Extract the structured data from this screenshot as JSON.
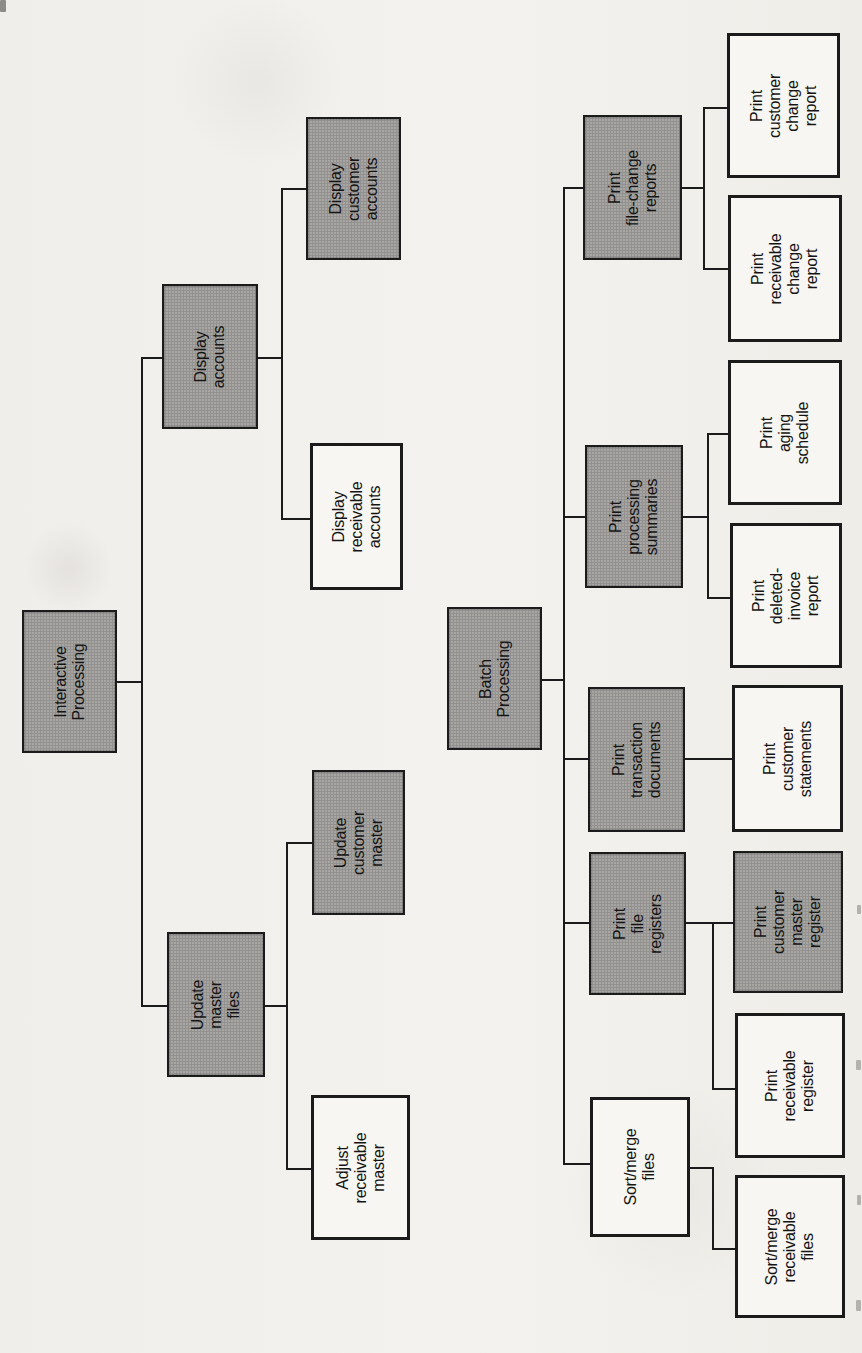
{
  "diagram": {
    "type": "structure-chart",
    "orientation": "page-rotated-90-text-reads-bottom-to-top",
    "colors": {
      "paper": "#f2f0ec",
      "shaded_box_fill": "#a8a6a3",
      "plain_box_fill": "#f7f6f2",
      "border": "#1b1b1b",
      "line": "#1b1b1b",
      "text": "#141414"
    },
    "trees": [
      {
        "root_id": "interactive-processing",
        "root_label": "Interactive Processing"
      },
      {
        "root_id": "batch-processing",
        "root_label": "Batch Processing"
      }
    ]
  },
  "nodes": [
    {
      "id": "interactive-processing",
      "label": "Interactive\nProcessing",
      "parent": null,
      "shaded": true,
      "x": 22,
      "y": 610,
      "w": 95,
      "h": 143
    },
    {
      "id": "display-accounts",
      "label": "Display\naccounts",
      "parent": "interactive-processing",
      "shaded": true,
      "x": 162,
      "y": 284,
      "w": 96,
      "h": 145
    },
    {
      "id": "display-customer-accounts",
      "label": "Display\ncustomer\naccounts",
      "parent": "display-accounts",
      "shaded": true,
      "x": 306,
      "y": 117,
      "w": 95,
      "h": 143
    },
    {
      "id": "display-receivable-accounts",
      "label": "Display\nreceivable\naccounts",
      "parent": "display-accounts",
      "shaded": false,
      "x": 310,
      "y": 443,
      "w": 93,
      "h": 147
    },
    {
      "id": "update-master-files",
      "label": "Update\nmaster\nfiles",
      "parent": "interactive-processing",
      "shaded": true,
      "x": 167,
      "y": 932,
      "w": 98,
      "h": 145
    },
    {
      "id": "update-customer-master",
      "label": "Update\ncustomer\nmaster",
      "parent": "update-master-files",
      "shaded": true,
      "x": 312,
      "y": 770,
      "w": 93,
      "h": 145
    },
    {
      "id": "adjust-receivable-master",
      "label": "Adjust\nreceivable\nmaster",
      "parent": "update-master-files",
      "shaded": false,
      "x": 311,
      "y": 1095,
      "w": 99,
      "h": 145
    },
    {
      "id": "batch-processing",
      "label": "Batch\nProcessing",
      "parent": null,
      "shaded": true,
      "x": 447,
      "y": 607,
      "w": 95,
      "h": 143
    },
    {
      "id": "print-file-change-reports",
      "label": "Print\nfile-change\nreports",
      "parent": "batch-processing",
      "shaded": true,
      "x": 583,
      "y": 115,
      "w": 99,
      "h": 145
    },
    {
      "id": "print-customer-change-report",
      "label": "Print\ncustomer\nchange\nreport",
      "parent": "print-file-change-reports",
      "shaded": false,
      "x": 727,
      "y": 33,
      "w": 113,
      "h": 145
    },
    {
      "id": "print-receivable-change-report",
      "label": "Print\nreceivable\nchange\nreport",
      "parent": "print-file-change-reports",
      "shaded": false,
      "x": 728,
      "y": 195,
      "w": 114,
      "h": 147
    },
    {
      "id": "print-processing-summaries",
      "label": "Print\nprocessing\nsummaries",
      "parent": "batch-processing",
      "shaded": true,
      "x": 585,
      "y": 445,
      "w": 98,
      "h": 143
    },
    {
      "id": "print-aging-schedule",
      "label": "Print\naging\nschedule",
      "parent": "print-processing-summaries",
      "shaded": false,
      "x": 728,
      "y": 360,
      "w": 114,
      "h": 145
    },
    {
      "id": "print-deleted-invoice-report",
      "label": "Print\ndeleted-\ninvoice\nreport",
      "parent": "print-processing-summaries",
      "shaded": false,
      "x": 730,
      "y": 523,
      "w": 112,
      "h": 145
    },
    {
      "id": "print-transaction-documents",
      "label": "Print\ntransaction\ndocuments",
      "parent": "batch-processing",
      "shaded": true,
      "x": 588,
      "y": 687,
      "w": 97,
      "h": 145
    },
    {
      "id": "print-customer-statements",
      "label": "Print\ncustomer\nstatements",
      "parent": "print-transaction-documents",
      "shaded": false,
      "x": 732,
      "y": 685,
      "w": 111,
      "h": 147
    },
    {
      "id": "print-file-registers",
      "label": "Print\nfile\nregisters",
      "parent": "batch-processing",
      "shaded": true,
      "x": 589,
      "y": 852,
      "w": 97,
      "h": 143
    },
    {
      "id": "print-customer-master-register",
      "label": "Print\ncustomer\nmaster\nregister",
      "parent": "print-file-registers",
      "shaded": true,
      "x": 733,
      "y": 851,
      "w": 110,
      "h": 142
    },
    {
      "id": "print-receivable-register",
      "label": "Print\nreceivable\nregister",
      "parent": "print-file-registers",
      "shaded": false,
      "x": 735,
      "y": 1013,
      "w": 110,
      "h": 145
    },
    {
      "id": "sort-merge-files",
      "label": "Sort/merge\nfiles",
      "parent": "batch-processing",
      "shaded": false,
      "x": 590,
      "y": 1097,
      "w": 100,
      "h": 140
    },
    {
      "id": "sort-merge-receivable-files",
      "label": "Sort/merge\nreceivable\nfiles",
      "parent": "sort-merge-files",
      "shaded": false,
      "x": 735,
      "y": 1175,
      "w": 110,
      "h": 143
    }
  ],
  "connectors": [
    [
      117,
      681,
      141,
      681
    ],
    [
      141,
      357,
      141,
      1005
    ],
    [
      141,
      357,
      162,
      357
    ],
    [
      141,
      1005,
      167,
      1005
    ],
    [
      258,
      357,
      281,
      357
    ],
    [
      281,
      188,
      281,
      518
    ],
    [
      281,
      188,
      306,
      188
    ],
    [
      281,
      518,
      310,
      518
    ],
    [
      265,
      1005,
      286,
      1005
    ],
    [
      286,
      842,
      286,
      1168
    ],
    [
      286,
      842,
      312,
      842
    ],
    [
      286,
      1168,
      311,
      1168
    ],
    [
      542,
      679,
      563,
      679
    ],
    [
      563,
      187,
      563,
      1163
    ],
    [
      563,
      187,
      583,
      187
    ],
    [
      563,
      516,
      585,
      516
    ],
    [
      563,
      758,
      588,
      758
    ],
    [
      563,
      922,
      589,
      922
    ],
    [
      563,
      1163,
      590,
      1163
    ],
    [
      682,
      187,
      703,
      187
    ],
    [
      703,
      107,
      703,
      268
    ],
    [
      703,
      107,
      727,
      107
    ],
    [
      703,
      268,
      728,
      268
    ],
    [
      683,
      516,
      707,
      516
    ],
    [
      707,
      433,
      707,
      597
    ],
    [
      707,
      433,
      728,
      433
    ],
    [
      707,
      597,
      730,
      597
    ],
    [
      685,
      758,
      732,
      758
    ],
    [
      686,
      922,
      733,
      922
    ],
    [
      712,
      922,
      712,
      1088
    ],
    [
      712,
      1088,
      735,
      1088
    ],
    [
      690,
      1167,
      712,
      1167
    ],
    [
      712,
      1167,
      712,
      1248
    ],
    [
      712,
      1248,
      735,
      1248
    ]
  ]
}
